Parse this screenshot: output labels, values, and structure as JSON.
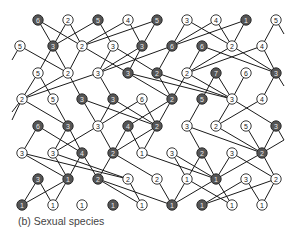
{
  "caption": "(b) Sexual species",
  "colors": {
    "dark_node": "#555555",
    "light_node": "#ffffff",
    "edge": "#1a1a1a",
    "caption": "#444444"
  },
  "rows": [
    {
      "y": 20,
      "nodes": [
        {
          "x": 38,
          "label": "6",
          "dark": true
        },
        {
          "x": 68,
          "label": "2",
          "dark": false
        },
        {
          "x": 98,
          "label": "5",
          "dark": true
        },
        {
          "x": 128,
          "label": "4",
          "dark": false
        },
        {
          "x": 157,
          "label": "5",
          "dark": true
        },
        {
          "x": 187,
          "label": "3",
          "dark": false
        },
        {
          "x": 216,
          "label": "4",
          "dark": false
        },
        {
          "x": 246,
          "label": "1",
          "dark": true
        },
        {
          "x": 276,
          "label": "5",
          "dark": false
        }
      ]
    },
    {
      "y": 46,
      "nodes": [
        {
          "x": 20,
          "label": "5",
          "dark": false
        },
        {
          "x": 53,
          "label": "3",
          "dark": true
        },
        {
          "x": 82,
          "label": "2",
          "dark": false
        },
        {
          "x": 113,
          "label": "3",
          "dark": false
        },
        {
          "x": 142,
          "label": "3",
          "dark": true
        },
        {
          "x": 172,
          "label": "6",
          "dark": true
        },
        {
          "x": 202,
          "label": "6",
          "dark": true
        },
        {
          "x": 232,
          "label": "2",
          "dark": false
        },
        {
          "x": 262,
          "label": "4",
          "dark": false
        }
      ]
    },
    {
      "y": 73,
      "nodes": [
        {
          "x": 38,
          "label": "5",
          "dark": false
        },
        {
          "x": 68,
          "label": "2",
          "dark": false
        },
        {
          "x": 98,
          "label": "3",
          "dark": false
        },
        {
          "x": 128,
          "label": "3",
          "dark": true
        },
        {
          "x": 157,
          "label": "2",
          "dark": true
        },
        {
          "x": 187,
          "label": "2",
          "dark": false
        },
        {
          "x": 216,
          "label": "7",
          "dark": true
        },
        {
          "x": 246,
          "label": "6",
          "dark": false
        },
        {
          "x": 276,
          "label": "3",
          "dark": true
        }
      ]
    },
    {
      "y": 99,
      "nodes": [
        {
          "x": 22,
          "label": "2",
          "dark": false
        },
        {
          "x": 53,
          "label": "5",
          "dark": false
        },
        {
          "x": 82,
          "label": "3",
          "dark": true
        },
        {
          "x": 113,
          "label": "3",
          "dark": true
        },
        {
          "x": 142,
          "label": "6",
          "dark": false
        },
        {
          "x": 172,
          "label": "2",
          "dark": true
        },
        {
          "x": 202,
          "label": "5",
          "dark": true
        },
        {
          "x": 232,
          "label": "3",
          "dark": false
        },
        {
          "x": 262,
          "label": "4",
          "dark": false
        }
      ]
    },
    {
      "y": 126,
      "nodes": [
        {
          "x": 38,
          "label": "6",
          "dark": true
        },
        {
          "x": 68,
          "label": "3",
          "dark": true
        },
        {
          "x": 98,
          "label": "3",
          "dark": false
        },
        {
          "x": 128,
          "label": "4",
          "dark": true
        },
        {
          "x": 157,
          "label": "2",
          "dark": true
        },
        {
          "x": 187,
          "label": "3",
          "dark": false
        },
        {
          "x": 216,
          "label": "2",
          "dark": false
        },
        {
          "x": 246,
          "label": "5",
          "dark": false
        },
        {
          "x": 276,
          "label": "3",
          "dark": true
        }
      ]
    },
    {
      "y": 153,
      "nodes": [
        {
          "x": 22,
          "label": "3",
          "dark": false
        },
        {
          "x": 53,
          "label": "3",
          "dark": false
        },
        {
          "x": 82,
          "label": "4",
          "dark": true
        },
        {
          "x": 113,
          "label": "2",
          "dark": true
        },
        {
          "x": 142,
          "label": "1",
          "dark": false
        },
        {
          "x": 172,
          "label": "3",
          "dark": false
        },
        {
          "x": 202,
          "label": "2",
          "dark": true
        },
        {
          "x": 232,
          "label": "3",
          "dark": false
        },
        {
          "x": 262,
          "label": "2",
          "dark": true
        }
      ]
    },
    {
      "y": 179,
      "nodes": [
        {
          "x": 38,
          "label": "3",
          "dark": true
        },
        {
          "x": 68,
          "label": "1",
          "dark": true
        },
        {
          "x": 98,
          "label": "2",
          "dark": true
        },
        {
          "x": 128,
          "label": "2",
          "dark": false
        },
        {
          "x": 157,
          "label": "2",
          "dark": false
        },
        {
          "x": 187,
          "label": "1",
          "dark": false
        },
        {
          "x": 216,
          "label": "1",
          "dark": true
        },
        {
          "x": 246,
          "label": "3",
          "dark": false
        },
        {
          "x": 276,
          "label": "2",
          "dark": false
        }
      ]
    },
    {
      "y": 205,
      "nodes": [
        {
          "x": 22,
          "label": "1",
          "dark": true
        },
        {
          "x": 53,
          "label": "1",
          "dark": false
        },
        {
          "x": 82,
          "label": "1",
          "dark": false
        },
        {
          "x": 113,
          "label": "1",
          "dark": true
        },
        {
          "x": 142,
          "label": "1",
          "dark": false
        },
        {
          "x": 172,
          "label": "1",
          "dark": true
        },
        {
          "x": 202,
          "label": "1",
          "dark": true
        },
        {
          "x": 232,
          "label": "1",
          "dark": false
        },
        {
          "x": 262,
          "label": "1",
          "dark": false
        }
      ]
    }
  ],
  "edges": [
    [
      0,
      0,
      1,
      1
    ],
    [
      0,
      0,
      1,
      2
    ],
    [
      0,
      1,
      1,
      1
    ],
    [
      0,
      1,
      1,
      2
    ],
    [
      0,
      2,
      1,
      1
    ],
    [
      0,
      2,
      1,
      3
    ],
    [
      0,
      3,
      1,
      2
    ],
    [
      0,
      3,
      1,
      4
    ],
    [
      0,
      4,
      1,
      2
    ],
    [
      0,
      4,
      1,
      4
    ],
    [
      0,
      5,
      1,
      5
    ],
    [
      0,
      5,
      1,
      7
    ],
    [
      0,
      6,
      1,
      5
    ],
    [
      0,
      6,
      1,
      7
    ],
    [
      0,
      7,
      1,
      5
    ],
    [
      0,
      7,
      1,
      7
    ],
    [
      0,
      8,
      1,
      8
    ],
    [
      1,
      0,
      2,
      1
    ],
    [
      1,
      1,
      2,
      0
    ],
    [
      1,
      1,
      2,
      1
    ],
    [
      1,
      2,
      2,
      1
    ],
    [
      1,
      2,
      2,
      3
    ],
    [
      1,
      3,
      2,
      2
    ],
    [
      1,
      3,
      2,
      4
    ],
    [
      1,
      4,
      2,
      2
    ],
    [
      1,
      4,
      2,
      3
    ],
    [
      1,
      5,
      2,
      2
    ],
    [
      1,
      5,
      2,
      4
    ],
    [
      1,
      6,
      2,
      5
    ],
    [
      1,
      6,
      2,
      8
    ],
    [
      1,
      7,
      2,
      5
    ],
    [
      1,
      7,
      2,
      8
    ],
    [
      1,
      8,
      2,
      8
    ],
    [
      1,
      8,
      2,
      5
    ],
    [
      2,
      0,
      3,
      0
    ],
    [
      2,
      0,
      3,
      1
    ],
    [
      2,
      1,
      3,
      0
    ],
    [
      2,
      1,
      3,
      2
    ],
    [
      2,
      2,
      3,
      0
    ],
    [
      2,
      2,
      3,
      3
    ],
    [
      2,
      3,
      3,
      7
    ],
    [
      2,
      3,
      3,
      5
    ],
    [
      2,
      4,
      3,
      5
    ],
    [
      2,
      4,
      3,
      7
    ],
    [
      2,
      5,
      3,
      5
    ],
    [
      2,
      5,
      3,
      7
    ],
    [
      2,
      6,
      3,
      6
    ],
    [
      2,
      6,
      3,
      7
    ],
    [
      2,
      7,
      3,
      7
    ],
    [
      2,
      8,
      3,
      8
    ],
    [
      3,
      0,
      4,
      1
    ],
    [
      3,
      1,
      4,
      1
    ],
    [
      3,
      2,
      4,
      2
    ],
    [
      3,
      2,
      4,
      4
    ],
    [
      3,
      3,
      4,
      2
    ],
    [
      3,
      3,
      4,
      4
    ],
    [
      3,
      4,
      4,
      2
    ],
    [
      3,
      4,
      4,
      4
    ],
    [
      3,
      5,
      4,
      4
    ],
    [
      3,
      5,
      4,
      3
    ],
    [
      3,
      6,
      4,
      5
    ],
    [
      3,
      7,
      4,
      6
    ],
    [
      3,
      7,
      4,
      8
    ],
    [
      3,
      8,
      4,
      6
    ],
    [
      4,
      0,
      5,
      0
    ],
    [
      4,
      0,
      5,
      2
    ],
    [
      4,
      1,
      5,
      1
    ],
    [
      4,
      1,
      5,
      2
    ],
    [
      4,
      2,
      5,
      1
    ],
    [
      4,
      2,
      5,
      3
    ],
    [
      4,
      3,
      5,
      3
    ],
    [
      4,
      3,
      5,
      4
    ],
    [
      4,
      4,
      5,
      3
    ],
    [
      4,
      4,
      5,
      4
    ],
    [
      4,
      5,
      5,
      6
    ],
    [
      4,
      5,
      5,
      8
    ],
    [
      4,
      6,
      5,
      8
    ],
    [
      4,
      7,
      5,
      8
    ],
    [
      4,
      8,
      5,
      8
    ],
    [
      5,
      0,
      6,
      1
    ],
    [
      5,
      0,
      6,
      3
    ],
    [
      5,
      1,
      6,
      1
    ],
    [
      5,
      1,
      6,
      3
    ],
    [
      5,
      2,
      6,
      1
    ],
    [
      5,
      2,
      6,
      2
    ],
    [
      5,
      3,
      6,
      2
    ],
    [
      5,
      3,
      6,
      4
    ],
    [
      5,
      4,
      6,
      6
    ],
    [
      5,
      5,
      6,
      5
    ],
    [
      5,
      5,
      6,
      6
    ],
    [
      5,
      6,
      6,
      5
    ],
    [
      5,
      6,
      6,
      6
    ],
    [
      5,
      7,
      6,
      6
    ],
    [
      5,
      7,
      6,
      8
    ],
    [
      5,
      8,
      6,
      6
    ],
    [
      5,
      8,
      6,
      8
    ],
    [
      6,
      0,
      7,
      0
    ],
    [
      6,
      0,
      7,
      1
    ],
    [
      6,
      1,
      7,
      0
    ],
    [
      6,
      1,
      7,
      1
    ],
    [
      6,
      2,
      7,
      4
    ],
    [
      6,
      2,
      7,
      5
    ],
    [
      6,
      3,
      7,
      4
    ],
    [
      6,
      4,
      7,
      5
    ],
    [
      6,
      5,
      7,
      5
    ],
    [
      6,
      5,
      7,
      7
    ],
    [
      6,
      6,
      7,
      5
    ],
    [
      6,
      6,
      7,
      7
    ],
    [
      6,
      7,
      7,
      6
    ],
    [
      6,
      7,
      7,
      8
    ],
    [
      6,
      8,
      7,
      6
    ],
    [
      6,
      8,
      7,
      8
    ]
  ]
}
